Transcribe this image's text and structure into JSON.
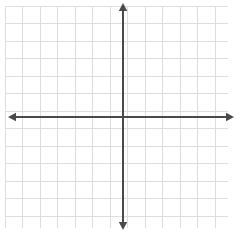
{
  "figure": {
    "type": "blank-cartesian-coordinate-plane",
    "title": "",
    "width": 241,
    "height": 235,
    "background_color": "#ffffff"
  },
  "grid": {
    "line_color": "#dedede",
    "line_width": 1,
    "spacing_px": 17.5,
    "left_px": 5,
    "top_px": 6,
    "right_px": 228,
    "bottom_px": 228,
    "columns": 13,
    "rows": 13,
    "visible": true
  },
  "axes": {
    "line_color": "#4a4a4a",
    "line_width": 2,
    "origin_x_px": 123,
    "origin_y_px": 117,
    "arrowheads": true,
    "x_axis": {
      "label": "",
      "left_tip_px": 8,
      "right_tip_px": 234,
      "y_px": 117,
      "tick_labels": []
    },
    "y_axis": {
      "label": "",
      "top_tip_px": 3,
      "bottom_tip_px": 230,
      "x_px": 123,
      "tick_labels": []
    }
  },
  "chart_data": {
    "type": "scatter",
    "title": "",
    "subtitle": "",
    "xlabel": "",
    "ylabel": "",
    "xlim": [
      -7,
      6
    ],
    "ylim": [
      -6,
      6
    ],
    "x_tick_labels": [],
    "y_tick_labels": [],
    "grid": true,
    "legend": null,
    "series": [],
    "annotations": []
  }
}
